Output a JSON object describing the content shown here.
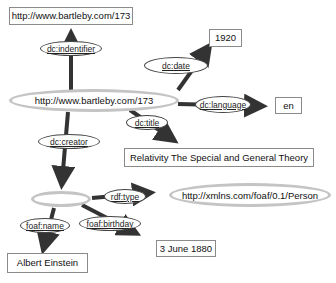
{
  "diagram": {
    "type": "RDF graph",
    "nodes": {
      "subject": {
        "label": "http://www.bartleby.com/173",
        "shape": "ellipse"
      },
      "identifier_value": {
        "label": "http://www.bartleby.com/173",
        "shape": "box"
      },
      "date_value": {
        "label": "1920",
        "shape": "box"
      },
      "language_value": {
        "label": "en",
        "shape": "box"
      },
      "title_value": {
        "label": "Relativity The Special and General Theory",
        "shape": "box"
      },
      "creator": {
        "label": "",
        "shape": "ellipse"
      },
      "person_class": {
        "label": "http://xmlns.com/foaf/0.1/Person",
        "shape": "ellipse"
      },
      "birthday_value": {
        "label": "3 June 1880",
        "shape": "box"
      },
      "name_value": {
        "label": "Albert Einstein",
        "shape": "box"
      }
    },
    "predicates": {
      "identifier": "dc:indentifier",
      "date": "dc:date",
      "language": "dc:language",
      "title": "dc:title",
      "creator": "dc:creator",
      "type": "rdf:type",
      "birthday": "foaf:birthday",
      "name": "foaf:name"
    },
    "edges": [
      {
        "from": "subject",
        "predicate": "dc:indentifier",
        "to": "identifier_value"
      },
      {
        "from": "subject",
        "predicate": "dc:date",
        "to": "date_value"
      },
      {
        "from": "subject",
        "predicate": "dc:language",
        "to": "language_value"
      },
      {
        "from": "subject",
        "predicate": "dc:title",
        "to": "title_value"
      },
      {
        "from": "subject",
        "predicate": "dc:creator",
        "to": "creator"
      },
      {
        "from": "creator",
        "predicate": "rdf:type",
        "to": "person_class"
      },
      {
        "from": "creator",
        "predicate": "foaf:birthday",
        "to": "birthday_value"
      },
      {
        "from": "creator",
        "predicate": "foaf:name",
        "to": "name_value"
      }
    ],
    "colors": {
      "edge": "#333333",
      "ellipse_border": "#c4c4c4",
      "box_border": "#8a8a8a",
      "background": "#ffffff"
    }
  }
}
